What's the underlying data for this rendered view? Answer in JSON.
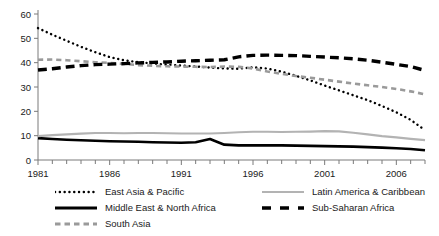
{
  "chart_data": {
    "type": "line",
    "title": "",
    "subtitle": "",
    "xlabel": "",
    "ylabel": "",
    "xlim": [
      1981,
      2008
    ],
    "ylim": [
      0,
      60
    ],
    "yticks": [
      0,
      10,
      20,
      30,
      40,
      50,
      60
    ],
    "xticks_labeled": [
      1981,
      1986,
      1991,
      1996,
      2001,
      2006
    ],
    "xtick_every": 1,
    "grid": false,
    "legend_position": "bottom",
    "x": [
      1981,
      1982,
      1983,
      1984,
      1985,
      1986,
      1987,
      1988,
      1989,
      1990,
      1991,
      1992,
      1993,
      1994,
      1995,
      1996,
      1997,
      1998,
      1999,
      2000,
      2001,
      2002,
      2003,
      2004,
      2005,
      2006,
      2007,
      2008
    ],
    "series": [
      {
        "name": "East Asia & Pacific",
        "style": "dotted",
        "color": "#000000",
        "width": 2.4,
        "values": [
          54.2,
          51.5,
          49.0,
          46.5,
          44.3,
          42.3,
          41.0,
          40.2,
          39.7,
          39.2,
          38.8,
          38.4,
          38.0,
          37.6,
          37.5,
          38.1,
          37.6,
          36.3,
          34.6,
          32.7,
          30.6,
          28.6,
          26.6,
          24.6,
          22.2,
          19.6,
          16.5,
          12.3
        ]
      },
      {
        "name": "Middle East & North Africa",
        "style": "solid",
        "color": "#000000",
        "width": 2.6,
        "values": [
          9.0,
          8.6,
          8.3,
          8.1,
          7.9,
          7.7,
          7.6,
          7.5,
          7.3,
          7.2,
          7.1,
          7.3,
          8.6,
          6.3,
          6.0,
          6.0,
          6.0,
          6.0,
          5.9,
          5.8,
          5.7,
          5.6,
          5.5,
          5.3,
          5.1,
          4.8,
          4.5,
          4.0
        ]
      },
      {
        "name": "South Asia",
        "style": "dashed",
        "color": "#9a9a9a",
        "width": 2.6,
        "values": [
          41.2,
          41.3,
          41.0,
          40.6,
          40.2,
          39.9,
          39.5,
          39.0,
          38.7,
          38.5,
          38.4,
          38.3,
          38.2,
          38.4,
          38.3,
          37.6,
          36.4,
          35.4,
          34.5,
          33.8,
          33.0,
          32.2,
          31.4,
          30.7,
          30.0,
          29.2,
          28.2,
          27.0
        ]
      },
      {
        "name": "Latin America & Caribbean",
        "style": "solid",
        "color": "#b3b3b3",
        "width": 2.2,
        "values": [
          9.8,
          10.2,
          10.5,
          10.8,
          11.1,
          11.1,
          11.0,
          11.1,
          11.1,
          11.0,
          10.9,
          10.9,
          10.9,
          11.1,
          11.4,
          11.6,
          11.6,
          11.5,
          11.6,
          11.7,
          11.9,
          11.8,
          11.2,
          10.5,
          9.8,
          9.3,
          8.7,
          8.2
        ]
      },
      {
        "name": "Sub-Saharan Africa",
        "style": "bold-dashed",
        "color": "#000000",
        "width": 3.4,
        "values": [
          37.0,
          37.5,
          38.2,
          38.8,
          39.2,
          39.4,
          39.6,
          39.9,
          40.1,
          40.3,
          40.6,
          40.8,
          41.0,
          41.2,
          42.4,
          43.0,
          43.1,
          43.0,
          42.9,
          42.6,
          42.3,
          42.0,
          41.6,
          41.0,
          40.2,
          39.3,
          38.4,
          36.8
        ]
      }
    ]
  },
  "axes": {
    "y_tick_labels": [
      "0",
      "10",
      "20",
      "30",
      "40",
      "50",
      "60"
    ],
    "x_tick_labels": [
      "1981",
      "1986",
      "1991",
      "1996",
      "2001",
      "2006"
    ]
  },
  "legend": {
    "entries": [
      {
        "label": "East Asia & Pacific",
        "swatch": "dotted-black",
        "column": "left"
      },
      {
        "label": "Middle East & North Africa",
        "swatch": "solid-black",
        "column": "left"
      },
      {
        "label": "South Asia",
        "swatch": "dashed-gray",
        "column": "left"
      },
      {
        "label": "Latin America & Caribbean",
        "swatch": "solid-gray",
        "column": "right"
      },
      {
        "label": "Sub-Saharan Africa",
        "swatch": "bold-dash-black",
        "column": "right"
      }
    ]
  }
}
